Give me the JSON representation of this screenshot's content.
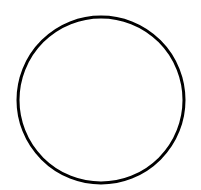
{
  "canvas": {
    "width": 201,
    "height": 190,
    "background": "#ffffff"
  },
  "shapes": [
    {
      "type": "circle",
      "cx": 101,
      "cy": 100,
      "r": 83,
      "stroke": "#000000",
      "stroke_width": 3,
      "fill": "none"
    }
  ]
}
